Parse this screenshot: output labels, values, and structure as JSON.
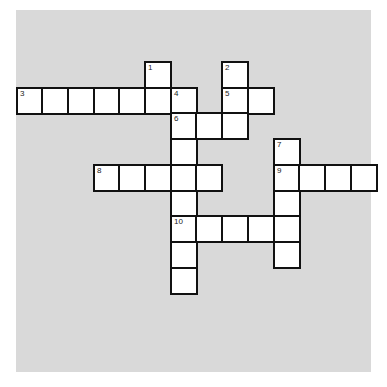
{
  "puzzle": {
    "grid": {
      "origin_x": 16.5,
      "origin_y": 62,
      "cell_size": 25.7
    },
    "colors": {
      "panel": "#d9d9d9",
      "cell": "#ffffff",
      "border": "#111111"
    },
    "entries": [
      {
        "number": "1",
        "direction": "down",
        "col": 5,
        "row": 0,
        "length": 2
      },
      {
        "number": "2",
        "direction": "down",
        "col": 8,
        "row": 0,
        "length": 3
      },
      {
        "number": "3",
        "direction": "across",
        "col": 0,
        "row": 1,
        "length": 7
      },
      {
        "number": "4",
        "direction": "down",
        "col": 6,
        "row": 1,
        "length": 8
      },
      {
        "number": "5",
        "direction": "across",
        "col": 8,
        "row": 1,
        "length": 2
      },
      {
        "number": "6",
        "direction": "across",
        "col": 6,
        "row": 2,
        "length": 3
      },
      {
        "number": "7",
        "direction": "down",
        "col": 10,
        "row": 3,
        "length": 5
      },
      {
        "number": "8",
        "direction": "across",
        "col": 3,
        "row": 4,
        "length": 5
      },
      {
        "number": "9",
        "direction": "across",
        "col": 10,
        "row": 4,
        "length": 4
      },
      {
        "number": "10",
        "direction": "across",
        "col": 6,
        "row": 6,
        "length": 5
      }
    ]
  }
}
